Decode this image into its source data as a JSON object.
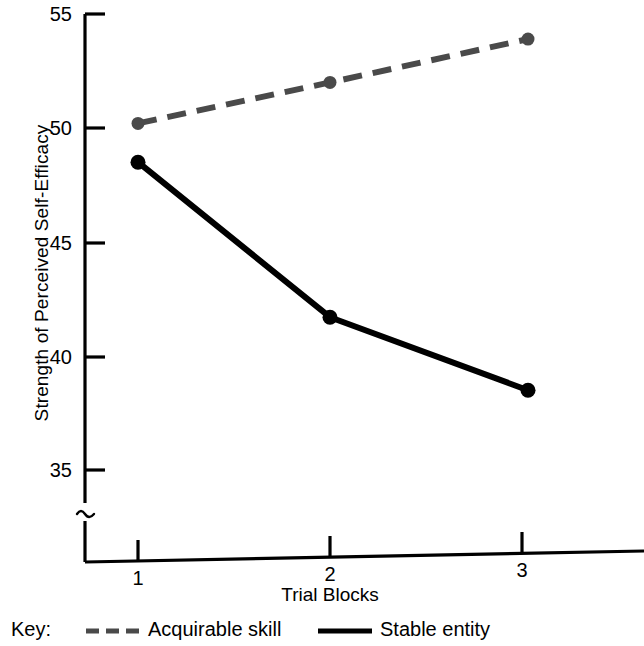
{
  "chart_data": {
    "type": "line",
    "title": "",
    "subtitle": "",
    "xlabel": "Trial Blocks",
    "ylabel": "Strength of Perceived Self-Efficacy",
    "x": [
      1,
      2,
      3
    ],
    "xtick_labels": [
      "1",
      "2",
      "3"
    ],
    "ytick_labels": [
      "35",
      "40",
      "45",
      "50",
      "55"
    ],
    "ytick_values": [
      35,
      40,
      45,
      50,
      55
    ],
    "ylim": [
      32.5,
      55
    ],
    "xlim": [
      0.45,
      3.6
    ],
    "grid": false,
    "axis_break": "≈",
    "axis_break_note": "y-axis broken below 35",
    "legend_position": "below-plot",
    "series": [
      {
        "name": "Acquirable skill",
        "values": [
          50.2,
          52.0,
          53.9
        ],
        "style": "dashed",
        "color": "#4a4a4a",
        "marker": "circle"
      },
      {
        "name": "Stable entity",
        "values": [
          48.5,
          41.7,
          38.5
        ],
        "style": "solid",
        "color": "#000000",
        "marker": "circle"
      }
    ]
  },
  "legend": {
    "key_label": "Key:",
    "entries": [
      {
        "label": "Acquirable skill",
        "style": "dashed",
        "color": "#4a4a4a"
      },
      {
        "label": "Stable entity",
        "style": "solid",
        "color": "#000000"
      }
    ]
  },
  "colors": {
    "background": "#ffffff",
    "axis": "#000000",
    "series_acquirable_skill": "#4a4a4a",
    "series_stable_entity": "#000000"
  }
}
